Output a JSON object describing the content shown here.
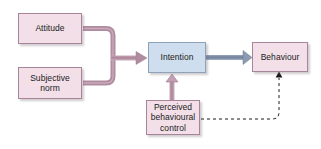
{
  "diagram": {
    "background_color": "#ffffff",
    "nodes": [
      {
        "id": "attitude",
        "label": "Attitude",
        "fill": "#f2dfe8",
        "border": "#a78498",
        "shape": "rectangle"
      },
      {
        "id": "subjective-norm",
        "label": "Subjective\nnorm",
        "fill": "#f2dfe8",
        "border": "#a78498",
        "shape": "rectangle"
      },
      {
        "id": "intention",
        "label": "Intention",
        "fill": "#cfdeee",
        "border": "#8fa3b8",
        "shape": "rectangle"
      },
      {
        "id": "behaviour",
        "label": "Behaviour",
        "fill": "#f2dfe8",
        "border": "#a78498",
        "shape": "rectangle"
      },
      {
        "id": "perceived-behavioural-control",
        "label": "Perceived\nbehavioural\ncontrol",
        "fill": "#f2dfe8",
        "border": "#a78498",
        "shape": "rectangle"
      }
    ],
    "edges": [
      {
        "id": "attitude-to-intention",
        "from": "attitude",
        "to": "intention",
        "style": "solid",
        "color": "#b08ca0",
        "arrowhead": true
      },
      {
        "id": "subjective-norm-to-intention",
        "from": "subjective-norm",
        "to": "intention",
        "style": "solid",
        "color": "#b08ca0",
        "arrowhead": true
      },
      {
        "id": "pbc-to-intention",
        "from": "perceived-behavioural-control",
        "to": "intention",
        "style": "solid",
        "color": "#b08ca0",
        "arrowhead": true
      },
      {
        "id": "intention-to-behaviour",
        "from": "intention",
        "to": "behaviour",
        "style": "solid",
        "color": "#7d8ba4",
        "arrowhead": true
      },
      {
        "id": "pbc-to-behaviour",
        "from": "perceived-behavioural-control",
        "to": "behaviour",
        "style": "dashed",
        "color": "#1b1b1b",
        "arrowhead": true
      }
    ],
    "colors": {
      "pink_fill": "#f2dfe8",
      "pink_border": "#a78498",
      "blue_fill": "#cfdeee",
      "blue_border": "#8fa3b8",
      "pink_connector": "#b08ca0",
      "blue_connector": "#7d8ba4",
      "dashed_connector": "#1b1b1b"
    }
  }
}
